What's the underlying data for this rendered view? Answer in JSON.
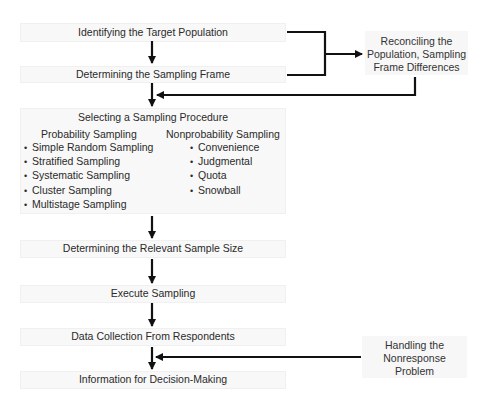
{
  "diagram": {
    "steps": [
      {
        "id": "target",
        "label": "Identifying the Target Population"
      },
      {
        "id": "frame",
        "label": "Determining the Sampling Frame"
      },
      {
        "id": "procedure",
        "label": "Selecting a Sampling Procedure",
        "probability": {
          "title": "Probability Sampling",
          "items": [
            "Simple Random Sampling",
            "Stratified Sampling",
            "Systematic Sampling",
            "Cluster Sampling",
            "Multistage Sampling"
          ]
        },
        "nonprobability": {
          "title": "Nonprobability Sampling",
          "items": [
            "Convenience",
            "Judgmental",
            "Quota",
            "Snowball"
          ]
        }
      },
      {
        "id": "size",
        "label": "Determining the Relevant Sample Size"
      },
      {
        "id": "execute",
        "label": "Execute Sampling"
      },
      {
        "id": "collect",
        "label": "Data Collection From Respondents"
      },
      {
        "id": "info",
        "label": "Information for Decision-Making"
      }
    ],
    "side_boxes": {
      "reconcile": {
        "lines": [
          "Reconciling the",
          "Population, Sampling",
          "Frame Differences"
        ]
      },
      "nonresponse": {
        "lines": [
          "Handling the",
          "Nonresponse",
          "Problem"
        ]
      }
    },
    "colors": {
      "box_fill": "#f8f8f8",
      "arrow": "#111111",
      "text": "#2a2a2a",
      "background": "#ffffff"
    }
  }
}
